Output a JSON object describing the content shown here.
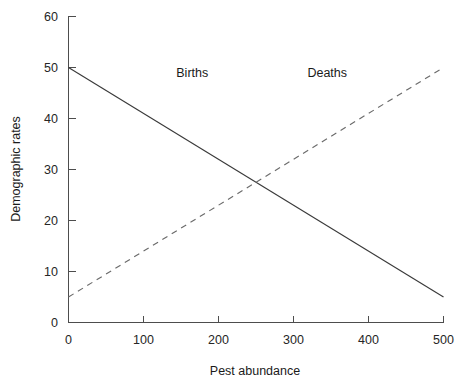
{
  "chart_data": {
    "type": "line",
    "title": "",
    "subtitle": "",
    "xlabel": "Pest abundance",
    "ylabel": "Demographic rates",
    "xlim": [
      0,
      500
    ],
    "ylim": [
      0,
      60
    ],
    "xticks": [
      0,
      100,
      200,
      300,
      400,
      500
    ],
    "yticks": [
      0,
      10,
      20,
      30,
      40,
      50,
      60
    ],
    "xtick_labels": [
      "0",
      "100",
      "200",
      "300",
      "400",
      "500"
    ],
    "ytick_labels": [
      "0",
      "10",
      "20",
      "30",
      "40",
      "50",
      "60"
    ],
    "grid": false,
    "legend_position": "inline-annotations",
    "series": [
      {
        "name": "Births",
        "style": "solid",
        "color": "#3a3a3a",
        "x": [
          0,
          500
        ],
        "values": [
          50,
          5
        ],
        "label_x": 165,
        "label_y": 49
      },
      {
        "name": "Deaths",
        "style": "dashed",
        "color": "#6b6b6b",
        "x": [
          0,
          500
        ],
        "values": [
          5,
          50
        ],
        "label_x": 345,
        "label_y": 49
      }
    ],
    "annotations": [
      {
        "text": "Births",
        "x": 165,
        "y": 49
      },
      {
        "text": "Deaths",
        "x": 345,
        "y": 49
      }
    ],
    "intersection": {
      "x": 260,
      "y": 27.5
    }
  },
  "labels": {
    "xlabel": "Pest abundance",
    "ylabel": "Demographic rates",
    "series_births": "Births",
    "series_deaths": "Deaths",
    "xtick_0": "0",
    "xtick_1": "100",
    "xtick_2": "200",
    "xtick_3": "300",
    "xtick_4": "400",
    "xtick_5": "500",
    "ytick_0": "0",
    "ytick_1": "10",
    "ytick_2": "20",
    "ytick_3": "30",
    "ytick_4": "40",
    "ytick_5": "50",
    "ytick_6": "60"
  },
  "colors": {
    "background": "#ffffff",
    "axis": "#4d4d4d",
    "text": "#1a1a1a",
    "births_line": "#3a3a3a",
    "deaths_line": "#6b6b6b"
  }
}
